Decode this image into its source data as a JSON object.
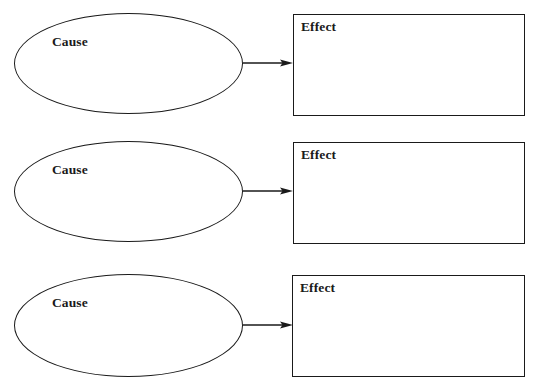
{
  "diagram": {
    "type": "cause-effect graphic organizer",
    "rows": [
      {
        "cause": {
          "label": "Cause",
          "text": ""
        },
        "effect": {
          "label": "Effect",
          "text": ""
        },
        "connector": "arrow-right"
      },
      {
        "cause": {
          "label": "Cause",
          "text": ""
        },
        "effect": {
          "label": "Effect",
          "text": ""
        },
        "connector": "arrow-right"
      },
      {
        "cause": {
          "label": "Cause",
          "text": ""
        },
        "effect": {
          "label": "Effect",
          "text": ""
        },
        "connector": "arrow-right"
      }
    ],
    "colors": {
      "stroke": "#1a1a1a",
      "background": "#ffffff",
      "text": "#1a1a1a"
    }
  }
}
